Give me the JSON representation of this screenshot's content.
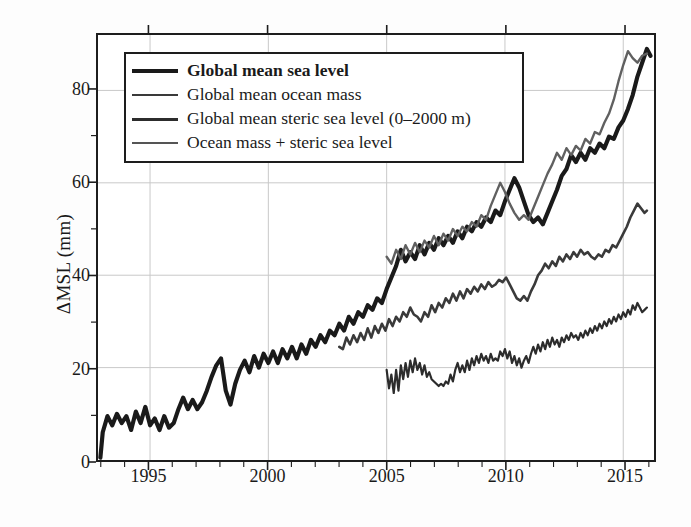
{
  "axes": {
    "ylabel": "ΔMSL (mm)",
    "yticks": [
      0,
      20,
      40,
      60,
      80
    ],
    "yminor": [
      10,
      30,
      50,
      70
    ],
    "ylim": [
      0,
      92
    ],
    "xticks": [
      1995,
      2000,
      2005,
      2010,
      2015
    ],
    "xlim": [
      1992.8,
      2016.3
    ],
    "grid": true
  },
  "legend": {
    "position": "upper-left-inside",
    "items": [
      {
        "label": "Global mean sea level",
        "color": "#1a1a1a",
        "width": 4.2,
        "bold": true
      },
      {
        "label": "Global mean ocean mass",
        "color": "#3a3a3a",
        "width": 2.6,
        "bold": false
      },
      {
        "label": "Global mean steric sea level (0–2000 m)",
        "color": "#2c2c2c",
        "width": 3.0,
        "bold": false
      },
      {
        "label": "Ocean mass + steric sea level",
        "color": "#555555",
        "width": 2.4,
        "bold": false
      }
    ]
  },
  "chart_data": {
    "type": "line",
    "title": "",
    "xlabel": "",
    "ylabel": "ΔMSL (mm)",
    "xlim": [
      1992.8,
      2016.3
    ],
    "ylim": [
      0,
      92
    ],
    "grid": true,
    "legend_position": "upper-left",
    "series": [
      {
        "name": "Global mean sea level",
        "color": "#1a1a1a",
        "width": 4.2,
        "x": [
          1992.9,
          1993.0,
          1993.2,
          1993.4,
          1993.6,
          1993.8,
          1994.0,
          1994.2,
          1994.4,
          1994.6,
          1994.8,
          1995.0,
          1995.2,
          1995.4,
          1995.6,
          1995.8,
          1996.0,
          1996.2,
          1996.4,
          1996.6,
          1996.8,
          1997.0,
          1997.2,
          1997.4,
          1997.6,
          1997.8,
          1998.0,
          1998.2,
          1998.4,
          1998.6,
          1998.8,
          1999.0,
          1999.2,
          1999.4,
          1999.6,
          1999.8,
          2000.0,
          2000.2,
          2000.4,
          2000.6,
          2000.8,
          2001.0,
          2001.2,
          2001.4,
          2001.6,
          2001.8,
          2002.0,
          2002.2,
          2002.4,
          2002.6,
          2002.8,
          2003.0,
          2003.2,
          2003.4,
          2003.6,
          2003.8,
          2004.0,
          2004.2,
          2004.4,
          2004.6,
          2004.8,
          2005.0,
          2005.2,
          2005.4,
          2005.6,
          2005.8,
          2006.0,
          2006.2,
          2006.4,
          2006.6,
          2006.8,
          2007.0,
          2007.2,
          2007.4,
          2007.6,
          2007.8,
          2008.0,
          2008.2,
          2008.4,
          2008.6,
          2008.8,
          2009.0,
          2009.2,
          2009.4,
          2009.6,
          2009.8,
          2010.0,
          2010.2,
          2010.4,
          2010.6,
          2010.8,
          2011.0,
          2011.2,
          2011.4,
          2011.6,
          2011.8,
          2012.0,
          2012.2,
          2012.4,
          2012.6,
          2012.8,
          2013.0,
          2013.2,
          2013.4,
          2013.6,
          2013.8,
          2014.0,
          2014.2,
          2014.4,
          2014.6,
          2014.8,
          2015.0,
          2015.2,
          2015.4,
          2015.6,
          2015.8,
          2016.0,
          2016.15
        ],
        "y": [
          0.5,
          6.0,
          9.5,
          7.5,
          10.0,
          8.0,
          9.5,
          6.5,
          10.5,
          8.0,
          11.5,
          7.5,
          9.0,
          6.5,
          9.5,
          7.0,
          8.0,
          11.0,
          13.5,
          11.0,
          13.0,
          11.0,
          12.5,
          15.0,
          18.0,
          20.5,
          22.0,
          15.0,
          12.0,
          16.5,
          19.5,
          21.5,
          19.0,
          22.5,
          20.0,
          23.0,
          21.0,
          23.5,
          21.0,
          24.0,
          22.0,
          24.5,
          22.0,
          25.0,
          23.0,
          26.0,
          24.5,
          27.0,
          25.5,
          28.0,
          27.0,
          29.5,
          28.0,
          31.0,
          29.5,
          32.0,
          31.0,
          33.5,
          32.5,
          35.0,
          34.0,
          37.0,
          39.5,
          42.0,
          45.5,
          43.0,
          45.0,
          43.5,
          46.5,
          44.5,
          47.0,
          45.5,
          48.0,
          46.5,
          48.5,
          47.0,
          49.5,
          48.0,
          50.5,
          49.5,
          51.5,
          50.5,
          52.5,
          51.5,
          54.0,
          53.0,
          56.0,
          58.5,
          61.0,
          59.0,
          56.0,
          53.0,
          51.5,
          52.5,
          51.0,
          53.5,
          56.0,
          58.5,
          61.5,
          63.0,
          66.0,
          64.5,
          66.5,
          65.0,
          67.5,
          66.5,
          68.5,
          67.5,
          70.0,
          69.5,
          72.0,
          73.5,
          76.0,
          79.0,
          83.0,
          86.0,
          89.0,
          87.5
        ]
      },
      {
        "name": "Ocean mass + steric sea level",
        "color": "#606060",
        "width": 2.4,
        "x": [
          2005.0,
          2005.2,
          2005.4,
          2005.6,
          2005.8,
          2006.0,
          2006.2,
          2006.4,
          2006.6,
          2006.8,
          2007.0,
          2007.2,
          2007.4,
          2007.6,
          2007.8,
          2008.0,
          2008.2,
          2008.4,
          2008.6,
          2008.8,
          2009.0,
          2009.2,
          2009.4,
          2009.6,
          2009.8,
          2010.0,
          2010.2,
          2010.4,
          2010.6,
          2010.8,
          2011.0,
          2011.2,
          2011.4,
          2011.6,
          2011.8,
          2012.0,
          2012.2,
          2012.4,
          2012.6,
          2012.8,
          2013.0,
          2013.2,
          2013.4,
          2013.6,
          2013.8,
          2014.0,
          2014.2,
          2014.4,
          2014.6,
          2014.8,
          2015.0,
          2015.2,
          2015.4,
          2015.6,
          2015.8,
          2016.0
        ],
        "y": [
          44.0,
          42.5,
          45.5,
          43.5,
          46.5,
          44.5,
          47.0,
          45.0,
          47.5,
          46.0,
          48.5,
          46.5,
          49.0,
          47.5,
          50.0,
          48.5,
          50.5,
          49.5,
          51.5,
          50.5,
          53.0,
          52.0,
          55.0,
          57.5,
          60.0,
          58.0,
          55.5,
          53.5,
          52.0,
          53.0,
          52.0,
          54.5,
          57.0,
          59.5,
          62.0,
          64.0,
          66.5,
          65.0,
          67.5,
          66.0,
          68.0,
          67.0,
          69.5,
          68.5,
          71.0,
          70.5,
          73.0,
          75.0,
          78.0,
          82.0,
          85.5,
          88.5,
          87.0,
          86.0,
          87.5,
          88.0
        ]
      },
      {
        "name": "Global mean ocean mass",
        "color": "#3a3a3a",
        "width": 2.6,
        "x": [
          2003.0,
          2003.15,
          2003.3,
          2003.45,
          2003.6,
          2003.75,
          2003.9,
          2004.05,
          2004.2,
          2004.35,
          2004.5,
          2004.65,
          2004.8,
          2004.95,
          2005.1,
          2005.25,
          2005.4,
          2005.55,
          2005.7,
          2005.85,
          2006.0,
          2006.15,
          2006.3,
          2006.45,
          2006.6,
          2006.75,
          2006.9,
          2007.05,
          2007.2,
          2007.35,
          2007.5,
          2007.65,
          2007.8,
          2007.95,
          2008.1,
          2008.25,
          2008.4,
          2008.55,
          2008.7,
          2008.85,
          2009.0,
          2009.15,
          2009.3,
          2009.45,
          2009.6,
          2009.75,
          2009.9,
          2010.05,
          2010.2,
          2010.35,
          2010.5,
          2010.65,
          2010.8,
          2010.95,
          2011.1,
          2011.25,
          2011.4,
          2011.55,
          2011.7,
          2011.85,
          2012.0,
          2012.15,
          2012.3,
          2012.45,
          2012.6,
          2012.75,
          2012.9,
          2013.05,
          2013.2,
          2013.35,
          2013.5,
          2013.65,
          2013.8,
          2013.95,
          2014.1,
          2014.25,
          2014.4,
          2014.55,
          2014.7,
          2014.85,
          2015.0,
          2015.15,
          2015.3,
          2015.45,
          2015.6,
          2015.75,
          2015.9,
          2016.0
        ],
        "y": [
          24.5,
          24.0,
          26.5,
          25.0,
          27.0,
          25.5,
          27.5,
          26.0,
          28.5,
          26.5,
          29.0,
          27.5,
          29.5,
          28.0,
          30.5,
          29.0,
          31.0,
          30.0,
          32.0,
          31.0,
          33.0,
          31.5,
          31.0,
          30.0,
          32.0,
          31.0,
          33.5,
          32.0,
          34.0,
          33.0,
          35.0,
          34.0,
          36.0,
          34.5,
          36.5,
          35.0,
          37.0,
          36.0,
          37.5,
          36.5,
          38.0,
          37.0,
          38.5,
          37.5,
          38.0,
          39.0,
          38.5,
          39.5,
          38.0,
          36.5,
          35.0,
          34.5,
          35.5,
          34.5,
          36.5,
          38.0,
          40.0,
          41.0,
          42.5,
          41.5,
          43.0,
          42.0,
          44.0,
          43.0,
          44.5,
          43.5,
          45.0,
          44.0,
          45.5,
          44.5,
          45.0,
          44.0,
          43.5,
          44.5,
          44.0,
          45.5,
          45.0,
          46.5,
          46.0,
          47.5,
          49.0,
          50.5,
          52.5,
          54.0,
          55.5,
          54.5,
          53.5,
          54.0
        ]
      },
      {
        "name": "Global mean steric sea level (0–2000 m)",
        "color": "#2c2c2c",
        "width": 2.2,
        "x": [
          2005.0,
          2005.1,
          2005.2,
          2005.3,
          2005.4,
          2005.5,
          2005.6,
          2005.7,
          2005.8,
          2005.9,
          2006.0,
          2006.1,
          2006.2,
          2006.3,
          2006.4,
          2006.5,
          2006.6,
          2006.7,
          2006.8,
          2006.9,
          2007.0,
          2007.1,
          2007.2,
          2007.3,
          2007.4,
          2007.5,
          2007.6,
          2007.7,
          2007.8,
          2007.9,
          2008.0,
          2008.1,
          2008.2,
          2008.3,
          2008.4,
          2008.5,
          2008.6,
          2008.7,
          2008.8,
          2008.9,
          2009.0,
          2009.1,
          2009.2,
          2009.3,
          2009.4,
          2009.5,
          2009.6,
          2009.7,
          2009.8,
          2009.9,
          2010.0,
          2010.1,
          2010.2,
          2010.3,
          2010.4,
          2010.5,
          2010.6,
          2010.7,
          2010.8,
          2010.9,
          2011.0,
          2011.1,
          2011.2,
          2011.3,
          2011.4,
          2011.5,
          2011.6,
          2011.7,
          2011.8,
          2011.9,
          2012.0,
          2012.1,
          2012.2,
          2012.3,
          2012.4,
          2012.5,
          2012.6,
          2012.7,
          2012.8,
          2012.9,
          2013.0,
          2013.1,
          2013.2,
          2013.3,
          2013.4,
          2013.5,
          2013.6,
          2013.7,
          2013.8,
          2013.9,
          2014.0,
          2014.1,
          2014.2,
          2014.3,
          2014.4,
          2014.5,
          2014.6,
          2014.7,
          2014.8,
          2014.9,
          2015.0,
          2015.1,
          2015.2,
          2015.3,
          2015.4,
          2015.5,
          2015.6,
          2015.7,
          2015.8,
          2015.9,
          2016.0
        ],
        "y": [
          19.5,
          15.5,
          18.5,
          14.5,
          19.5,
          15.0,
          20.5,
          17.5,
          21.0,
          18.0,
          21.5,
          19.0,
          22.0,
          19.5,
          21.0,
          18.5,
          20.5,
          18.0,
          19.0,
          17.5,
          17.0,
          16.5,
          16.0,
          16.5,
          16.0,
          17.0,
          16.5,
          18.5,
          17.0,
          19.5,
          21.0,
          19.0,
          20.5,
          19.0,
          21.5,
          19.5,
          22.0,
          20.5,
          22.5,
          21.0,
          23.0,
          21.5,
          22.5,
          21.0,
          23.0,
          21.5,
          22.0,
          21.5,
          23.5,
          22.5,
          24.0,
          22.0,
          23.5,
          21.0,
          22.5,
          20.5,
          22.0,
          20.0,
          21.5,
          22.5,
          21.0,
          23.0,
          24.5,
          23.0,
          25.0,
          23.5,
          25.5,
          24.0,
          26.0,
          24.5,
          26.5,
          25.0,
          26.0,
          24.5,
          26.5,
          25.5,
          27.0,
          26.0,
          27.5,
          26.5,
          27.0,
          26.0,
          27.5,
          26.5,
          28.0,
          27.0,
          28.5,
          27.5,
          29.0,
          28.0,
          29.5,
          28.5,
          30.0,
          29.0,
          30.5,
          29.5,
          31.0,
          30.0,
          31.5,
          30.5,
          32.0,
          31.0,
          32.5,
          31.5,
          33.5,
          32.5,
          34.0,
          33.0,
          32.0,
          32.5,
          33.0
        ]
      }
    ]
  }
}
